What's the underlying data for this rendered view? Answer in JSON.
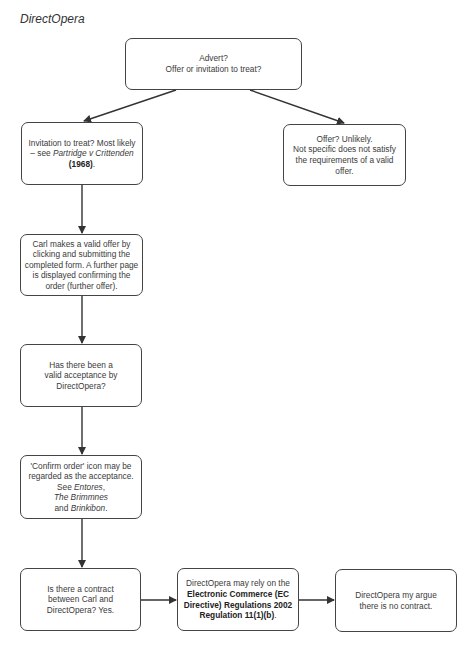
{
  "title": "DirectOpera",
  "nodes": {
    "advert": {
      "line1": "Advert?",
      "line2": "Offer or invitation to treat?"
    },
    "invitation": {
      "text_a": "Invitation to treat? Most likely – see ",
      "case_a": "Partridge v Crittenden",
      "year": "(1968)",
      "text_end": "."
    },
    "offer": {
      "line1": "Offer? Unlikely.",
      "line2": "Not specific does not satisfy the requirements of a valid offer."
    },
    "carl_offer": {
      "text": "Carl makes a valid offer by clicking and submitting the completed form. A further page is displayed confirming the order (further offer)."
    },
    "acceptance_question": {
      "text": "Has there been a valid acceptance by DirectOpera?"
    },
    "confirm_order": {
      "text_a": "'Confirm order' icon may be regarded as the acceptance. See ",
      "case_1": "Entores",
      "sep_1": ", ",
      "case_2": "The Brimmnes",
      "sep_2": " and ",
      "case_3": "Brinkibon",
      "text_end": "."
    },
    "contract_question": {
      "text": "Is there a contract between Carl and DirectOpera? Yes."
    },
    "regulation": {
      "text_a": "DirectOpera may rely on the ",
      "bold": "Electronic Commerce (EC Directive) Regulations 2002 Regulation 11(1)(b)",
      "text_end": "."
    },
    "no_contract": {
      "text": "DirectOpera my argue there is no contract."
    }
  },
  "colors": {
    "stroke": "#444444",
    "text": "#3a3a3a",
    "background": "#ffffff"
  }
}
